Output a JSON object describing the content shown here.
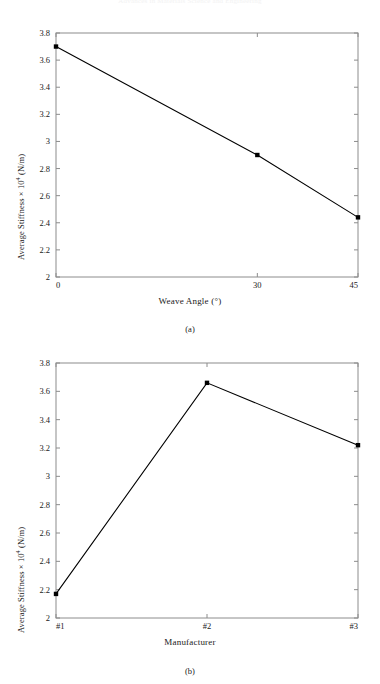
{
  "page": {
    "running_head": "Advances in Materials Science and Engineering"
  },
  "figures": [
    {
      "id": "a",
      "caption": "(a)",
      "xlabel": "Weave Angle (°)",
      "ylabel_text": "Average Stiffness × 10",
      "ylabel_sup": "4",
      "ylabel_units": " (N/m)"
    },
    {
      "id": "b",
      "caption": "(b)",
      "xlabel": "Manufacturer",
      "ylabel_text": "Average Stiffness × 10",
      "ylabel_sup": "4",
      "ylabel_units": " (N/m)"
    }
  ],
  "chart_data": [
    {
      "type": "line",
      "title": "",
      "subtitle": "(a)",
      "xlabel": "Weave Angle (°)",
      "ylabel": "Average Stiffness × 10^4 (N/m)",
      "x": [
        0,
        30,
        45
      ],
      "xtick_labels": [
        "0",
        "30",
        "45"
      ],
      "xtick_values": [
        0,
        30,
        45
      ],
      "xlim": [
        0,
        45
      ],
      "values": [
        3.7,
        2.9,
        2.44
      ],
      "ylim": [
        2,
        3.8
      ],
      "ytick_labels": [
        "2",
        "2.2",
        "2.4",
        "2.6",
        "2.8",
        "3",
        "3.2",
        "3.4",
        "3.6",
        "3.8"
      ],
      "ytick_values": [
        2,
        2.2,
        2.4,
        2.6,
        2.8,
        3,
        3.2,
        3.4,
        3.6,
        3.8
      ],
      "grid": false,
      "legend": "none",
      "marker": "square",
      "line_color": "#000000"
    },
    {
      "type": "line",
      "title": "",
      "subtitle": "(b)",
      "xlabel": "Manufacturer",
      "ylabel": "Average Stiffness × 10^4 (N/m)",
      "categories": [
        "#1",
        "#2",
        "#3"
      ],
      "xtick_labels": [
        "#1",
        "#2",
        "#3"
      ],
      "values": [
        2.17,
        3.66,
        3.22
      ],
      "ylim": [
        2,
        3.8
      ],
      "ytick_labels": [
        "2",
        "2.2",
        "2.4",
        "2.6",
        "2.8",
        "3",
        "3.2",
        "3.4",
        "3.6",
        "3.8"
      ],
      "ytick_values": [
        2,
        2.2,
        2.4,
        2.6,
        2.8,
        3,
        3.2,
        3.4,
        3.6,
        3.8
      ],
      "grid": false,
      "legend": "none",
      "marker": "square",
      "line_color": "#000000"
    }
  ]
}
